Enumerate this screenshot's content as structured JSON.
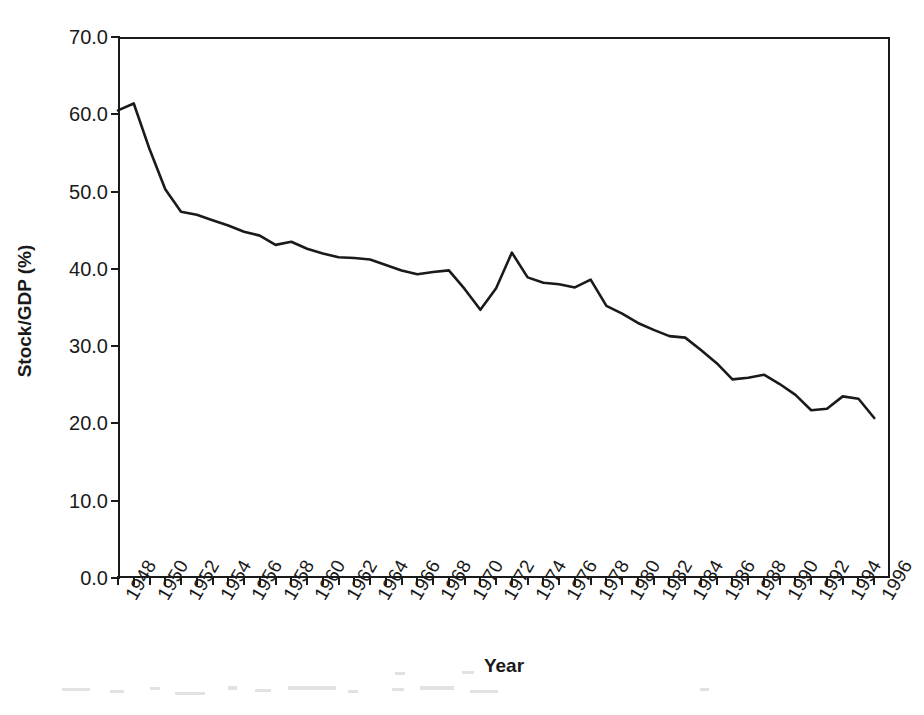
{
  "chart_data": {
    "type": "line",
    "title": "",
    "subtitle": "",
    "xlabel": "Year",
    "ylabel": "Stock/GDP (%)",
    "xlim": [
      1948,
      1997
    ],
    "ylim": [
      0.0,
      70.0
    ],
    "grid": false,
    "legend": null,
    "legend_position": "none",
    "ytick_labels": [
      "70.0",
      "60.0",
      "50.0",
      "40.0",
      "30.0",
      "20.0",
      "10.0",
      "0.0"
    ],
    "ytick_values": [
      70,
      60,
      50,
      40,
      30,
      20,
      10,
      0
    ],
    "xtick_labels": [
      "1948",
      "1950",
      "1952",
      "1954",
      "1956",
      "1958",
      "1960",
      "1962",
      "1964",
      "1966",
      "1968",
      "1970",
      "1972",
      "1974",
      "1976",
      "1978",
      "1980",
      "1982",
      "1984",
      "1986",
      "1988",
      "1990",
      "1992",
      "1994",
      "1996"
    ],
    "xtick_values": [
      1948,
      1950,
      1952,
      1954,
      1956,
      1958,
      1960,
      1962,
      1964,
      1966,
      1968,
      1970,
      1972,
      1974,
      1976,
      1978,
      1980,
      1982,
      1984,
      1986,
      1988,
      1990,
      1992,
      1994,
      1996
    ],
    "x": [
      1948,
      1949,
      1950,
      1951,
      1952,
      1953,
      1954,
      1955,
      1956,
      1957,
      1958,
      1959,
      1960,
      1961,
      1962,
      1963,
      1964,
      1965,
      1966,
      1967,
      1968,
      1969,
      1970,
      1971,
      1972,
      1973,
      1974,
      1975,
      1976,
      1977,
      1978,
      1979,
      1980,
      1981,
      1982,
      1983,
      1984,
      1985,
      1986,
      1987,
      1988,
      1989,
      1990,
      1991,
      1992,
      1993,
      1994,
      1995,
      1996
    ],
    "values": [
      60.5,
      61.4,
      55.5,
      50.3,
      47.4,
      47.0,
      46.3,
      45.6,
      44.8,
      44.3,
      43.1,
      43.5,
      42.6,
      42.0,
      41.5,
      41.4,
      41.2,
      40.5,
      39.8,
      39.3,
      39.6,
      39.8,
      37.4,
      34.7,
      37.5,
      42.1,
      38.9,
      38.2,
      38.0,
      37.6,
      38.6,
      35.2,
      34.2,
      33.0,
      32.1,
      31.3,
      31.1,
      29.5,
      27.8,
      25.7,
      25.9,
      26.3,
      25.1,
      23.7,
      21.7,
      21.9,
      23.5,
      23.2,
      20.7
    ],
    "series": [
      {
        "name": "Stock/GDP",
        "color": "#1a1a1a",
        "line_width": 2.6,
        "values": [
          60.5,
          61.4,
          55.5,
          50.3,
          47.4,
          47.0,
          46.3,
          45.6,
          44.8,
          44.3,
          43.1,
          43.5,
          42.6,
          42.0,
          41.5,
          41.4,
          41.2,
          40.5,
          39.8,
          39.3,
          39.6,
          39.8,
          37.4,
          34.7,
          37.5,
          42.1,
          38.9,
          38.2,
          38.0,
          37.6,
          38.6,
          35.2,
          34.2,
          33.0,
          32.1,
          31.3,
          31.1,
          29.5,
          27.8,
          25.7,
          25.9,
          26.3,
          25.1,
          23.7,
          21.7,
          21.9,
          23.5,
          23.2,
          20.7
        ]
      }
    ],
    "annotations": []
  }
}
